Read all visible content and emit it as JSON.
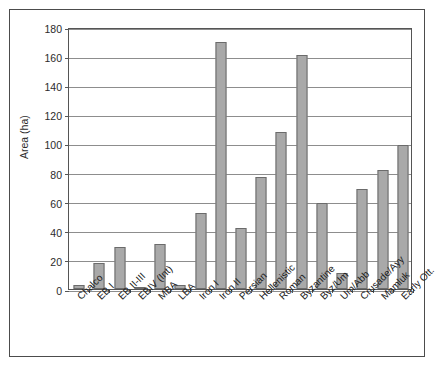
{
  "chart_data": {
    "type": "bar",
    "title": "",
    "xlabel": "",
    "ylabel": "Area (ha)",
    "ylim": [
      0,
      180
    ],
    "ytick_interval": 20,
    "yticks": [
      0,
      20,
      40,
      60,
      80,
      100,
      120,
      140,
      160,
      180
    ],
    "grid": true,
    "legend": "none",
    "bar_color": "#a9a9a9",
    "bar_edge_color": "#6b6b6b",
    "categories": [
      "Chalco",
      "EB I",
      "EB II-III",
      "EBIV (Int)",
      "MBA",
      "LBA",
      "Iron I",
      "Iron II",
      "Persian",
      "Hellenistic",
      "Roman",
      "Byzantine",
      "Byz/Um",
      "Um/Abb",
      "Crusade/Ayy",
      "Mamluk",
      "Early Ott."
    ],
    "values": [
      2.5,
      18,
      29,
      1,
      31,
      2.5,
      52,
      170,
      42,
      77,
      108,
      161,
      59,
      11,
      69,
      82,
      99
    ]
  }
}
